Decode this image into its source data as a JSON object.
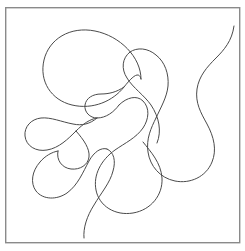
{
  "artwork": {
    "title": "abstract-continuous-curve-line-drawing",
    "description": "Hand-drawn single continuous meandering contour forming rounded lobes and teardrop loops inside a thin rectangular frame",
    "background_color": "#ffffff",
    "stroke_color": "#4a4a4a",
    "stroke_width": 1,
    "frame": {
      "name": "border-rectangle",
      "x": 5,
      "y": 7,
      "width": 235,
      "height": 236,
      "stroke_color": "#8a8a8a",
      "stroke_width": 1.4,
      "fill": "none"
    },
    "canvas": {
      "width": 245,
      "height": 251
    },
    "paths": [
      {
        "name": "main-contour",
        "d": "M 234 27 C 228 44 216 52 208 62 C 199 73 193 84 196 98 C 200 116 212 126 214 144 C 216 163 200 177 182 177 C 166 177 154 166 150 152 C 146 137 150 124 152 116 C 155 106 158 98 156 88 C 153 73 142 64 142 56 C 142 47 151 42 161 42 C 172 42 181 49 184 60 C 187 72 182 83 176 93 C 168 106 156 115 150 128 C 143 143 147 159 159 172 C 172 186 178 200 170 211 C 161 223 142 226 128 220 C 112 213 103 198 100 182 C 97 165 104 150 114 140 C 124 130 135 126 138 118 C 141 110 136 102 128 100 C 119 98 110 104 106 112 C 101 121 101 132 95 139 C 88 147 77 149 68 146 C 57 142 50 132 52 122 C 54 112 63 106 73 107 C 84 108 91 117 92 127 C 93 139 86 148 76 153 C 64 159 49 159 38 153 C 27 147 22 134 26 124 C 30 114 41 110 51 113 C 61 116 67 126 66 136 C 64 148 54 155 43 158 C 31 161 20 169 19 181 C 18 193 28 203 40 205 C 53 207 64 200 72 191 C 81 181 87 170 97 166 C 106 163 116 167 119 176 C 122 186 116 195 108 200 C 99 206 88 212 84 222 C 81 230 84 238 88 244",
        "stroke_color": "#4a4a4a",
        "stroke_width": 1
      }
    ]
  }
}
